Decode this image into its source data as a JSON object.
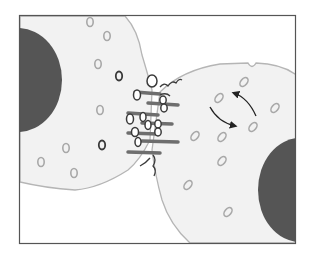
{
  "diagram": {
    "title": "",
    "frame": {
      "x": 19.5,
      "y": 15.5,
      "w": 276,
      "h": 228,
      "stroke": "#555555"
    },
    "colors": {
      "background": "#ffffff",
      "cell_fill": "#f2f2f2",
      "cell_outline": "#b5b5b5",
      "nucleus": "#555555",
      "vesicle_light": "#a8a8a8",
      "vesicle_dark": "#3a3a3a",
      "junction_bar": "#6e6e6e",
      "arrow": "#222222"
    },
    "left_cell": {
      "vesicles_light": [
        {
          "cx": 90,
          "cy": 22
        },
        {
          "cx": 107,
          "cy": 36
        },
        {
          "cx": 98,
          "cy": 64
        },
        {
          "cx": 100,
          "cy": 110
        },
        {
          "cx": 66,
          "cy": 148
        },
        {
          "cx": 41,
          "cy": 162
        },
        {
          "cx": 74,
          "cy": 173
        }
      ],
      "vesicles_dark": [
        {
          "cx": 119,
          "cy": 76
        },
        {
          "cx": 102,
          "cy": 145
        }
      ]
    },
    "right_cell": {
      "vesicles_light": [
        {
          "cx": 219,
          "cy": 98
        },
        {
          "cx": 244,
          "cy": 82
        },
        {
          "cx": 275,
          "cy": 108
        },
        {
          "cx": 253,
          "cy": 127
        },
        {
          "cx": 195,
          "cy": 136
        },
        {
          "cx": 222,
          "cy": 137
        },
        {
          "cx": 222,
          "cy": 161
        },
        {
          "cx": 188,
          "cy": 185
        },
        {
          "cx": 228,
          "cy": 212
        }
      ]
    },
    "arrows": [
      {
        "name": "arrow-up-left",
        "path": "M256 116 Q248 98 234 93"
      },
      {
        "name": "arrow-down-right",
        "path": "M210 107 Q218 122 235 126"
      }
    ]
  }
}
